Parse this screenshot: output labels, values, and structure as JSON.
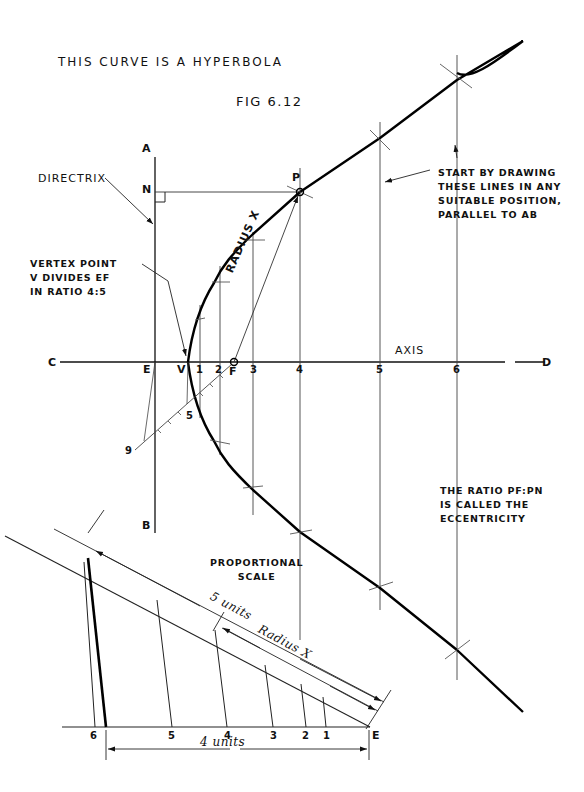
{
  "figure": {
    "title": "THIS CURVE IS A HYPERBOLA",
    "caption": "FIG 6.12"
  },
  "labels": {
    "directrix": "DIRECTRIX",
    "vertex_note": [
      "VERTEX POINT",
      "V DIVIDES EF",
      "IN RATIO 4:5"
    ],
    "start_note": [
      "START BY DRAWING",
      "THESE LINES IN ANY",
      "SUITABLE POSITION,",
      "PARALLEL TO AB"
    ],
    "eccentricity_note": [
      "THE RATIO PF:PN",
      "IS CALLED THE",
      "ECCENTRICITY"
    ],
    "radius_x": "RADIUS X",
    "axis": "AXIS",
    "proportional_scale": [
      "PROPORTIONAL",
      "SCALE"
    ],
    "five_units": "5 units",
    "radius_x_scale": "Radius X",
    "four_units": "4 units"
  },
  "points": {
    "A": "A",
    "B": "B",
    "C": "C",
    "D": "D",
    "E": "E",
    "V": "V",
    "F": "F",
    "N": "N",
    "P": "P"
  },
  "axis_ticks": [
    "1",
    "2",
    "3",
    "4",
    "5",
    "6"
  ],
  "construction_marks": [
    "5",
    "9"
  ],
  "scale_ticks": [
    "6",
    "5",
    "4",
    "3",
    "2",
    "1",
    "E"
  ]
}
